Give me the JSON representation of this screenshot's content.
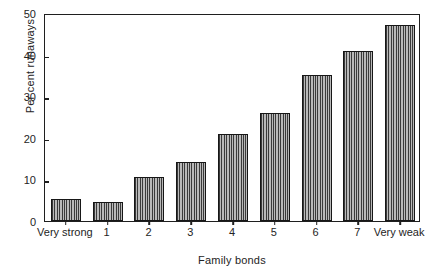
{
  "chart_data": {
    "type": "bar",
    "title": "",
    "xlabel": "Family bonds",
    "ylabel": "Per cent runaways",
    "categories": [
      "Very strong",
      "1",
      "2",
      "3",
      "4",
      "5",
      "6",
      "7",
      "Very weak"
    ],
    "values": [
      5.2,
      4.5,
      10.5,
      14.3,
      21.0,
      26.0,
      35.0,
      40.8,
      47.0
    ],
    "ylim": [
      0,
      50
    ],
    "yticks": [
      0,
      10,
      20,
      30,
      40,
      50
    ],
    "ytick_labels": [
      "0",
      "10",
      "20",
      "30",
      "40",
      "50"
    ],
    "xlim_note": "categorical",
    "grid": false,
    "legend": false,
    "legend_position": "none",
    "bar_fill": "vertical-hatch",
    "colors": {
      "axis": "#1f1f1f",
      "text": "#242424",
      "bar_hatch_dark": "#3a3a3a",
      "bar_hatch_light": "#b9b9b9",
      "bar_outline": "#171717",
      "background": "#ffffff"
    }
  }
}
